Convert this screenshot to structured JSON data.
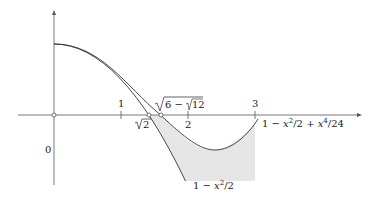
{
  "diagram": {
    "axes": {
      "x_ticks": [
        {
          "value": 1,
          "label": "1"
        },
        {
          "value": 2,
          "label": "2"
        },
        {
          "value": 3,
          "label": "3"
        }
      ],
      "origin_label": "0"
    },
    "points": [
      {
        "name": "sqrt2",
        "label": "√2",
        "x": 1.414
      },
      {
        "name": "sqrt6-sqrt12",
        "label": "√6 − √12",
        "x": 1.592
      }
    ],
    "curves": [
      {
        "name": "taylor-2",
        "label_parts": [
          "1 − ",
          "x",
          "2",
          "/2"
        ],
        "label": "1 − x²/2"
      },
      {
        "name": "taylor-4",
        "label": "1 − x²/2 + x⁴/24"
      }
    ],
    "colors": {
      "axis": "#555555",
      "curve": "#333333",
      "shade": "#e6e6e6"
    }
  },
  "text": {
    "tick1": "1",
    "tick2": "2",
    "tick3": "3",
    "origin": "0",
    "sqrt2_num": "2",
    "sqrt6_a": "6 − ",
    "sqrt6_b": "12",
    "curve2_one": "1 − ",
    "curve2_x": "x",
    "curve2_exp": "2",
    "curve2_rest": "/2",
    "curve4_one": "1 − ",
    "curve4_x1": "x",
    "curve4_e1": "2",
    "curve4_mid": "/2 + ",
    "curve4_x2": "x",
    "curve4_e2": "4",
    "curve4_end": "/24"
  }
}
